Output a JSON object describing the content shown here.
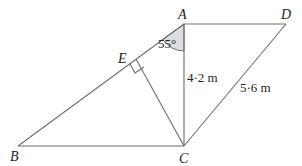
{
  "diagram": {
    "points": {
      "A": {
        "label": "A",
        "x": 184,
        "y": 24
      },
      "D": {
        "label": "D",
        "x": 286,
        "y": 24
      },
      "B": {
        "label": "B",
        "x": 18,
        "y": 146
      },
      "C": {
        "label": "C",
        "x": 184,
        "y": 146
      },
      "E": {
        "label": "E",
        "x": 138,
        "y": 57
      }
    },
    "angle_A": "55°",
    "length_AC": "4·2 m",
    "length_CD": "5·6 m",
    "colors": {
      "line": "#6d6e71",
      "angle_fill": "#dcdde0",
      "text": "#231f20"
    }
  }
}
